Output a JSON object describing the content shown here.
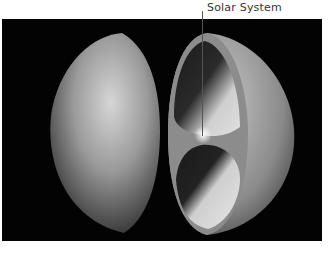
{
  "figure": {
    "label": "Solar System",
    "halves": [
      "outer-hemisphere-left",
      "cut-hemisphere-right"
    ],
    "colors": {
      "background": "#030303",
      "surface_light": "#d8d8d8",
      "surface_dark": "#3a3a3a",
      "page": "#ffffff",
      "label_text": "#333333"
    }
  }
}
